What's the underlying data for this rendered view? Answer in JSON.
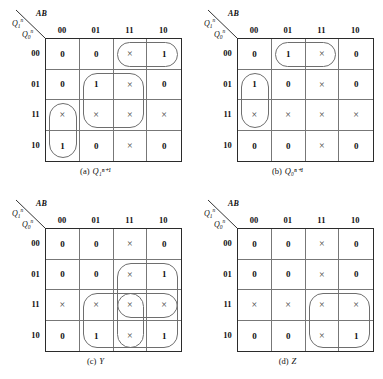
{
  "figure": {
    "column_header_label": "AB",
    "row_header_upper": "Q",
    "row_header_lower": "Q",
    "col_headers": [
      "00",
      "01",
      "11",
      "10"
    ],
    "row_headers": [
      "00",
      "01",
      "11",
      "10"
    ],
    "dontcare_glyph": "×"
  },
  "chart_data": {
    "type": "table",
    "xlabel": "AB",
    "ylabel": "Q1^n Q0^n",
    "categories": [
      "00",
      "01",
      "11",
      "10"
    ],
    "maps": [
      {
        "id": "a",
        "caption_tag": "(a)",
        "caption_symbol": "Q₁ⁿ⁺¹",
        "rows": [
          "00",
          "01",
          "11",
          "10"
        ],
        "cols": [
          "00",
          "01",
          "11",
          "10"
        ],
        "values": [
          [
            "0",
            "0",
            "×",
            "1"
          ],
          [
            "0",
            "1",
            "×",
            "0"
          ],
          [
            "×",
            "×",
            "×",
            "×"
          ],
          [
            "1",
            "0",
            "×",
            "0"
          ]
        ],
        "groups": [
          {
            "name": "group-row00-col11-col10",
            "r0": 0,
            "c0": 2,
            "rows": 1,
            "cols": 2,
            "shape": "pill"
          },
          {
            "name": "group-row01-row11-col01-col11",
            "r0": 1,
            "c0": 1,
            "rows": 2,
            "cols": 2,
            "shape": "square"
          },
          {
            "name": "group-row11-row10-col00",
            "r0": 2,
            "c0": 0,
            "rows": 2,
            "cols": 1,
            "shape": "pill"
          }
        ]
      },
      {
        "id": "b",
        "caption_tag": "(b)",
        "caption_symbol": "Q₀ⁿ⁺¹",
        "rows": [
          "00",
          "01",
          "11",
          "10"
        ],
        "cols": [
          "00",
          "01",
          "11",
          "10"
        ],
        "values": [
          [
            "0",
            "1",
            "×",
            "0"
          ],
          [
            "1",
            "0",
            "×",
            "0"
          ],
          [
            "×",
            "×",
            "×",
            "×"
          ],
          [
            "0",
            "0",
            "×",
            "0"
          ]
        ],
        "groups": [
          {
            "name": "group-row00-col01-col11",
            "r0": 0,
            "c0": 1,
            "rows": 1,
            "cols": 2,
            "shape": "pill"
          },
          {
            "name": "group-row01-row11-col00",
            "r0": 1,
            "c0": 0,
            "rows": 2,
            "cols": 1,
            "shape": "pill"
          }
        ]
      },
      {
        "id": "c",
        "caption_tag": "(c)",
        "caption_symbol": "Y",
        "rows": [
          "00",
          "01",
          "11",
          "10"
        ],
        "cols": [
          "00",
          "01",
          "11",
          "10"
        ],
        "values": [
          [
            "0",
            "0",
            "×",
            "0"
          ],
          [
            "0",
            "0",
            "×",
            "1"
          ],
          [
            "×",
            "×",
            "×",
            "×"
          ],
          [
            "0",
            "1",
            "×",
            "1"
          ]
        ],
        "groups": [
          {
            "name": "group-row01-row11-col11-col10",
            "r0": 1,
            "c0": 2,
            "rows": 2,
            "cols": 2,
            "shape": "square"
          },
          {
            "name": "group-row11-row10-col01-col10",
            "r0": 2,
            "c0": 1,
            "rows": 2,
            "cols": 3,
            "shape": "square"
          },
          {
            "name": "group-row11-row10-col11",
            "r0": 2,
            "c0": 2,
            "rows": 2,
            "cols": 1,
            "shape": "pill"
          }
        ]
      },
      {
        "id": "d",
        "caption_tag": "(d)",
        "caption_symbol": "Z",
        "rows": [
          "00",
          "01",
          "11",
          "10"
        ],
        "cols": [
          "00",
          "01",
          "11",
          "10"
        ],
        "values": [
          [
            "0",
            "0",
            "×",
            "0"
          ],
          [
            "0",
            "0",
            "×",
            "0"
          ],
          [
            "×",
            "×",
            "×",
            "×"
          ],
          [
            "0",
            "0",
            "×",
            "1"
          ]
        ],
        "groups": [
          {
            "name": "group-row11-row10-col11-col10",
            "r0": 2,
            "c0": 2,
            "rows": 2,
            "cols": 2,
            "shape": "square"
          }
        ]
      }
    ]
  }
}
